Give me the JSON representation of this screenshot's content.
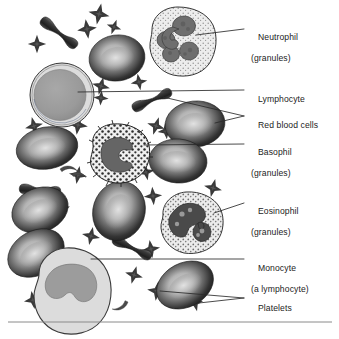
{
  "figure": {
    "background_color": "#ffffff",
    "line_color": "#2b2b2b",
    "text_color": "#1c1c1c",
    "baseline_rule_color": "#8a8a8a"
  },
  "labels": [
    {
      "id": "neutrophil",
      "name": "Neutrophil",
      "qualifier": "(granules)",
      "x": 248,
      "y": 22,
      "leader_count": 1
    },
    {
      "id": "lymphocyte",
      "name": "Lymphocyte",
      "qualifier": "",
      "x": 248,
      "y": 84,
      "leader_count": 1
    },
    {
      "id": "red-blood-cells",
      "name": "Red blood cells",
      "qualifier": "",
      "x": 248,
      "y": 110,
      "leader_count": 2
    },
    {
      "id": "basophil",
      "name": "Basophil",
      "qualifier": "(granules)",
      "x": 248,
      "y": 137,
      "leader_count": 1
    },
    {
      "id": "eosinophil",
      "name": "Eosinophil",
      "qualifier": "(granules)",
      "x": 248,
      "y": 196,
      "leader_count": 1
    },
    {
      "id": "monocyte",
      "name": "Monocyte",
      "qualifier": "(a lymphocyte)",
      "x": 248,
      "y": 253,
      "leader_count": 1
    },
    {
      "id": "platelets",
      "name": "Platelets",
      "qualifier": "",
      "x": 248,
      "y": 293,
      "leader_count": 2
    }
  ],
  "cells": {
    "neutrophil": {
      "label": "Neutrophil",
      "cytoplasm_color": "#e8e8e8",
      "nucleus_color": "#6e6e6e",
      "granule_color": "#8d8d8d",
      "shape": "irregular-round",
      "nucleus_lobes": 3,
      "cx": 182,
      "cy": 42,
      "r": 35
    },
    "lymphocyte": {
      "label": "Lymphocyte",
      "cytoplasm_color": "#d7d7d7",
      "nucleus_color": "#9a9a9a",
      "shape": "round",
      "nucleus_lobes": 1,
      "cx": 62,
      "cy": 95,
      "r": 32
    },
    "basophil": {
      "label": "Basophil",
      "cytoplasm_color": "#ededed",
      "nucleus_color": "#636363",
      "granule_color": "#2e2e2e",
      "shape": "spiky-round",
      "nucleus_lobes": 2,
      "cx": 119,
      "cy": 154,
      "r": 30
    },
    "eosinophil": {
      "label": "Eosinophil",
      "cytoplasm_color": "#ececec",
      "nucleus_color": "#4a4a4a",
      "granule_color": "#7a7a7a",
      "shape": "round",
      "nucleus_lobes": 2,
      "cx": 192,
      "cy": 223,
      "r": 31
    },
    "monocyte": {
      "label": "Monocyte",
      "cytoplasm_color": "#dcdcdc",
      "nucleus_color": "#9c9c9c",
      "shape": "irregular-round",
      "nucleus_lobes": 1,
      "cx": 73,
      "cy": 288,
      "r": 38
    }
  },
  "red_blood_cells": {
    "label": "Red blood cells",
    "fill_dark": "#2f2f2f",
    "fill_light": "#c9c9c9",
    "flat_view": [
      {
        "cx": 117,
        "cy": 58,
        "rx": 28,
        "ry": 23,
        "rot": -8
      },
      {
        "cx": 195,
        "cy": 124,
        "rx": 30,
        "ry": 23,
        "rot": -6
      },
      {
        "cx": 47,
        "cy": 148,
        "rx": 31,
        "ry": 21,
        "rot": -10
      },
      {
        "cx": 178,
        "cy": 161,
        "rx": 29,
        "ry": 22,
        "rot": 4
      },
      {
        "cx": 40,
        "cy": 210,
        "rx": 29,
        "ry": 22,
        "rot": -22
      },
      {
        "cx": 119,
        "cy": 211,
        "rx": 26,
        "ry": 30,
        "rot": 18
      },
      {
        "cx": 36,
        "cy": 253,
        "rx": 30,
        "ry": 22,
        "rot": -30
      },
      {
        "cx": 185,
        "cy": 285,
        "rx": 30,
        "ry": 22,
        "rot": -28
      }
    ],
    "edge_view": [
      {
        "cx": 59,
        "cy": 33,
        "len": 40,
        "rot": 38
      },
      {
        "cx": 152,
        "cy": 100,
        "len": 38,
        "rot": -24
      },
      {
        "cx": 40,
        "cy": 190,
        "len": 37,
        "rot": 4
      },
      {
        "cx": 132,
        "cy": 248,
        "len": 38,
        "rot": 26
      }
    ]
  },
  "platelets": {
    "label": "Platelets",
    "color": "#555555",
    "positions": [
      {
        "cx": 99,
        "cy": 14,
        "s": 7,
        "rot": 12
      },
      {
        "cx": 87,
        "cy": 29,
        "s": 6.5,
        "rot": -8
      },
      {
        "cx": 114,
        "cy": 27,
        "s": 5,
        "rot": 20
      },
      {
        "cx": 37,
        "cy": 44,
        "s": 6,
        "rot": 0
      },
      {
        "cx": 101,
        "cy": 86,
        "s": 6,
        "rot": 15
      },
      {
        "cx": 139,
        "cy": 82,
        "s": 5.5,
        "rot": -10
      },
      {
        "cx": 101,
        "cy": 98,
        "s": 5,
        "rot": 5
      },
      {
        "cx": 34,
        "cy": 126,
        "s": 6,
        "rot": -14
      },
      {
        "cx": 78,
        "cy": 125,
        "s": 6.5,
        "rot": 8
      },
      {
        "cx": 156,
        "cy": 126,
        "s": 6,
        "rot": 18
      },
      {
        "cx": 166,
        "cy": 131,
        "s": 5.5,
        "rot": -6
      },
      {
        "cx": 78,
        "cy": 175,
        "s": 6,
        "rot": 10
      },
      {
        "cx": 146,
        "cy": 172,
        "s": 5.5,
        "rot": -12
      },
      {
        "cx": 33,
        "cy": 207,
        "s": 6,
        "rot": 6
      },
      {
        "cx": 62,
        "cy": 209,
        "s": 5.5,
        "rot": -18
      },
      {
        "cx": 213,
        "cy": 188,
        "s": 6,
        "rot": 14
      },
      {
        "cx": 153,
        "cy": 196,
        "s": 6,
        "rot": -5
      },
      {
        "cx": 91,
        "cy": 236,
        "s": 6,
        "rot": 12
      },
      {
        "cx": 151,
        "cy": 249,
        "s": 6,
        "rot": -9
      },
      {
        "cx": 134,
        "cy": 275,
        "s": 6,
        "rot": 16
      },
      {
        "cx": 33,
        "cy": 300,
        "s": 6,
        "rot": -10
      },
      {
        "cx": 157,
        "cy": 291,
        "s": 6.5,
        "rot": 8
      },
      {
        "cx": 195,
        "cy": 303,
        "s": 5.5,
        "rot": -14
      }
    ]
  },
  "crescents": {
    "color": "#4a4a4a",
    "positions": [
      {
        "cx": 66,
        "cy": 171,
        "rot": 10
      },
      {
        "cx": 200,
        "cy": 246,
        "rot": -40
      },
      {
        "cx": 55,
        "cy": 310,
        "rot": -20
      },
      {
        "cx": 122,
        "cy": 304,
        "rot": 160
      }
    ]
  },
  "baseline_rule": {
    "y": 322,
    "x1": 8,
    "x2": 332
  }
}
